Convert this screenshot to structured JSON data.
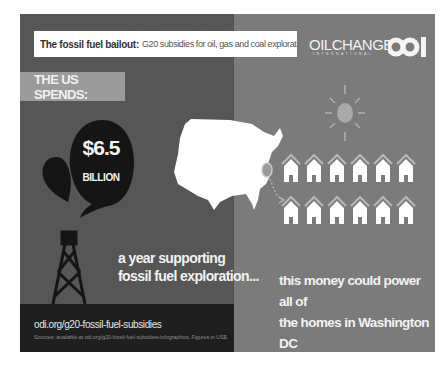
{
  "header": {
    "title_bold": "The fossil fuel bailout:",
    "title_rest": "G20 subsidies for oil, gas and coal exploration",
    "logos": [
      {
        "name": "OILCHANGE",
        "subtitle": "INTERNATIONAL"
      },
      {
        "name": "ODI"
      }
    ]
  },
  "left_panel": {
    "label": "THE US SPENDS:",
    "amount": "$6.5",
    "amount_unit": "BILLION",
    "caption_lines": [
      "a year supporting",
      "fossil fuel exploration..."
    ],
    "icons": [
      "oil-drop-icon",
      "oil-derrick-icon"
    ]
  },
  "right_panel": {
    "caption_lines": [
      "this money could power all of",
      "the homes in Washington DC",
      "with solar energy."
    ],
    "icons": [
      "us-map-icon",
      "sun-icon",
      "house-icon"
    ],
    "house_rows": 2,
    "houses_per_row": 6
  },
  "footer": {
    "url": "odi.org/g20-fossil-fuel-subsidies",
    "sources": "Sources: available at odi.org/g20-fossil-fuel-subsidies-infographics. Figures in US$."
  },
  "colors": {
    "left_panel_bg": "#565656",
    "right_panel_bg": "#7b7b7b",
    "ground_strip": "#1f1f1f",
    "label_bg": "#9b9b9b",
    "text_light": "#f2f2f2",
    "oil_black": "#151515"
  }
}
